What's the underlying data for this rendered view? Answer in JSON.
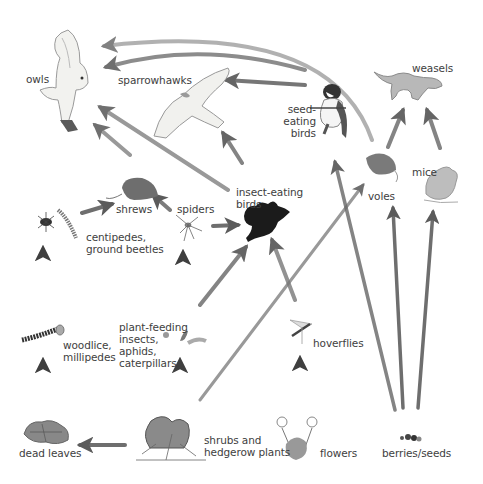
{
  "diagram": {
    "colors": {
      "arrow": "#4a4a4a",
      "arrow_fade": "#ffffff",
      "label": "#3e3e3e",
      "bird_dark": "#1a1a1a",
      "animal_grey": "#a8a8a8",
      "plant_grey": "#8c8c8c"
    },
    "nodes": {
      "owls": {
        "label": "owls",
        "icon": "owl-icon"
      },
      "sparrowhawks": {
        "label": "sparrowhawks",
        "icon": "sparrowhawk-icon"
      },
      "seed_eating_birds": {
        "label": "seed-\neating\nbirds",
        "icon": "seed-eating-bird-icon"
      },
      "weasels": {
        "label": "weasels",
        "icon": "weasel-icon"
      },
      "shrews": {
        "label": "shrews",
        "icon": "shrew-icon"
      },
      "spiders": {
        "label": "spiders",
        "icon": "spider-icon"
      },
      "insect_eating_birds": {
        "label": "insect-eating\nbirds",
        "icon": "insect-eating-bird-icon"
      },
      "voles": {
        "label": "voles",
        "icon": "vole-icon"
      },
      "mice": {
        "label": "mice",
        "icon": "mouse-icon"
      },
      "centipedes": {
        "label": "centipedes,\nground beetles",
        "icon": "beetle-centipede-icon"
      },
      "woodlice": {
        "label": "woodlice,\nmillipedes",
        "icon": "woodlouse-millipede-icon"
      },
      "plant_feeding_insects": {
        "label": "plant-feeding\ninsects,\naphids,\ncaterpillars",
        "icon": "insects-caterpillar-icon"
      },
      "hoverflies": {
        "label": "hoverflies",
        "icon": "hoverfly-icon"
      },
      "dead_leaves": {
        "label": "dead leaves",
        "icon": "dead-leaves-icon"
      },
      "shrubs": {
        "label": "shrubs and\nhedgerow plants",
        "icon": "shrubs-icon"
      },
      "flowers": {
        "label": "flowers",
        "icon": "flowers-icon"
      },
      "berries_seeds": {
        "label": "berries/seeds",
        "icon": "berries-seeds-icon"
      }
    },
    "edges": [
      {
        "from": "shrubs",
        "to": "dead_leaves"
      },
      {
        "from": "dead_leaves",
        "to": "woodlice"
      },
      {
        "from": "woodlice",
        "to": "centipedes"
      },
      {
        "from": "centipedes",
        "to": "shrews"
      },
      {
        "from": "shrubs",
        "to": "plant_feeding_insects"
      },
      {
        "from": "plant_feeding_insects",
        "to": "spiders"
      },
      {
        "from": "plant_feeding_insects",
        "to": "insect_eating_birds"
      },
      {
        "from": "shrubs",
        "to": "voles"
      },
      {
        "from": "flowers",
        "to": "hoverflies"
      },
      {
        "from": "hoverflies",
        "to": "insect_eating_birds"
      },
      {
        "from": "spiders",
        "to": "shrews"
      },
      {
        "from": "spiders",
        "to": "insect_eating_birds"
      },
      {
        "from": "shrews",
        "to": "owls"
      },
      {
        "from": "insect_eating_birds",
        "to": "owls"
      },
      {
        "from": "insect_eating_birds",
        "to": "sparrowhawks"
      },
      {
        "from": "seed_eating_birds",
        "to": "sparrowhawks"
      },
      {
        "from": "seed_eating_birds",
        "to": "owls"
      },
      {
        "from": "voles",
        "to": "owls"
      },
      {
        "from": "voles",
        "to": "weasels"
      },
      {
        "from": "mice",
        "to": "weasels"
      },
      {
        "from": "berries_seeds",
        "to": "seed_eating_birds"
      },
      {
        "from": "berries_seeds",
        "to": "voles"
      },
      {
        "from": "berries_seeds",
        "to": "mice"
      }
    ]
  }
}
